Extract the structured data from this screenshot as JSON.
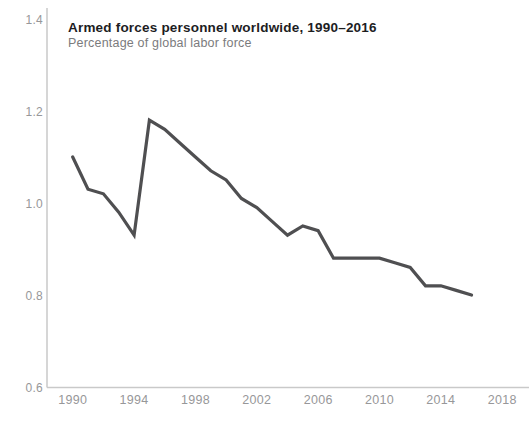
{
  "header": {
    "title": "Armed forces personnel worldwide, 1990–2016",
    "subtitle": "Percentage of global labor force"
  },
  "chart_data": {
    "type": "line",
    "title": "Armed forces personnel worldwide, 1990–2016",
    "subtitle": "Percentage of global labor force",
    "xlabel": "",
    "ylabel": "",
    "x": [
      1990,
      1991,
      1992,
      1993,
      1994,
      1995,
      1996,
      1997,
      1998,
      1999,
      2000,
      2001,
      2002,
      2003,
      2004,
      2005,
      2006,
      2007,
      2008,
      2009,
      2010,
      2011,
      2012,
      2013,
      2014,
      2015,
      2016
    ],
    "values": [
      1.1,
      1.03,
      1.02,
      0.98,
      0.93,
      1.18,
      1.16,
      1.13,
      1.1,
      1.07,
      1.05,
      1.01,
      0.99,
      0.96,
      0.93,
      0.95,
      0.94,
      0.88,
      0.88,
      0.88,
      0.88,
      0.87,
      0.86,
      0.82,
      0.82,
      0.81,
      0.8
    ],
    "series_name": "World",
    "xlim": [
      1988.3,
      2019.7
    ],
    "ylim": [
      0.6,
      1.4
    ],
    "x_ticks": [
      {
        "value": 1990,
        "label": "1990"
      },
      {
        "value": 1994,
        "label": "1994"
      },
      {
        "value": 1998,
        "label": "1998"
      },
      {
        "value": 2002,
        "label": "2002"
      },
      {
        "value": 2006,
        "label": "2006"
      },
      {
        "value": 2010,
        "label": "2010"
      },
      {
        "value": 2014,
        "label": "2014"
      },
      {
        "value": 2018,
        "label": "2018"
      }
    ],
    "y_ticks": [
      {
        "value": 1.4,
        "label": "1.4"
      },
      {
        "value": 1.2,
        "label": "1.2"
      },
      {
        "value": 1.0,
        "label": "1.0"
      },
      {
        "value": 0.8,
        "label": "0.8"
      },
      {
        "value": 0.6,
        "label": "0.6"
      }
    ],
    "grid": false,
    "legend": "none",
    "style": {
      "line_color": "#4f4f51",
      "axis_color": "#c9c9c9",
      "tick_label_color": "#979799",
      "title_color": "#1d1d1f",
      "subtitle_color": "#7b7b7d",
      "background_color": "#ffffff"
    }
  }
}
